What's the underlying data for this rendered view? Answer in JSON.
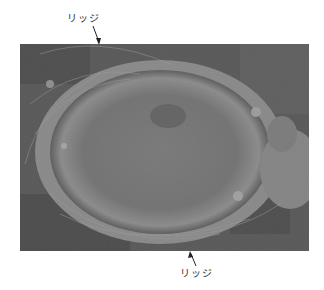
{
  "figure": {
    "labels": {
      "top": "リッジ",
      "bottom": "リッジ"
    }
  }
}
